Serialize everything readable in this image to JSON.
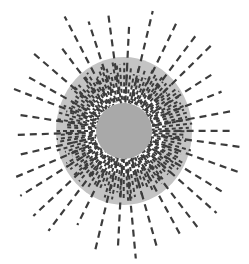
{
  "canvas": {
    "width": 249,
    "height": 264,
    "background": "#ffffff"
  },
  "figure": {
    "name": "radial-dashed-burst",
    "center_x": 124,
    "center_y": 131
  },
  "chart_data": {
    "type": "scatter",
    "title": "",
    "subtitle": "",
    "xlabel": "",
    "ylabel": "",
    "grid": false,
    "legend": null,
    "annotations": [],
    "coordinate_system": "polar",
    "center": [
      124,
      131
    ],
    "xlim": [
      0,
      249
    ],
    "ylim": [
      0,
      264
    ],
    "layers": [
      {
        "name": "outer-band",
        "shape": "disk",
        "fill": "#c4c4c4",
        "radius_x": 68,
        "radius_y": 74,
        "z": 1
      },
      {
        "name": "white-gap-annulus",
        "shape": "disk",
        "fill": "#ffffff",
        "radius_x": 42,
        "radius_y": 44,
        "z": 2
      },
      {
        "name": "inner-disk",
        "shape": "disk",
        "fill": "#a9a9a9",
        "radius_x": 28,
        "radius_y": 28,
        "z": 3
      }
    ],
    "series": [
      {
        "name": "short-dense-rays",
        "type": "radial-dashed-lines",
        "color": "#3c3c3c",
        "count": 112,
        "inner_radius": 28,
        "outer_radius": 64,
        "stroke_width": 2.0,
        "dash_pattern": [
          4,
          3
        ],
        "angle_start_deg": 0,
        "angle_step_deg": 3.2142857
      },
      {
        "name": "long-sparse-rays",
        "type": "radial-dashed-lines",
        "color": "#3c3c3c",
        "count": 34,
        "inner_radius": 30,
        "outer_radius": 118,
        "stroke_width": 2.2,
        "dash_pattern": [
          7,
          5
        ],
        "angle_start_deg": 4,
        "angle_step_deg": 10.5882353
      }
    ],
    "colors": {
      "background": "#ffffff",
      "inner_disk": "#a9a9a9",
      "outer_band": "#c4c4c4",
      "white_gap": "#ffffff",
      "ray_stroke": "#3c3c3c"
    }
  }
}
